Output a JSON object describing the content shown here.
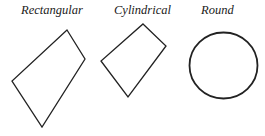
{
  "diagram": {
    "labels": {
      "rectangular": "Rectangular",
      "cylindrical": "Cylindrical",
      "round": "Round"
    },
    "shapes": {
      "rectangular": {
        "type": "quadrilateral",
        "points": "67,30 85,59 42,127 12,81"
      },
      "cylindrical": {
        "type": "quadrilateral",
        "points": "143,24 166,46 128,97 101,61"
      },
      "round": {
        "type": "ellipse",
        "cx": "223.5",
        "cy": "65.5",
        "rx": "34",
        "ry": "33"
      }
    },
    "stroke_color": "#222222"
  }
}
